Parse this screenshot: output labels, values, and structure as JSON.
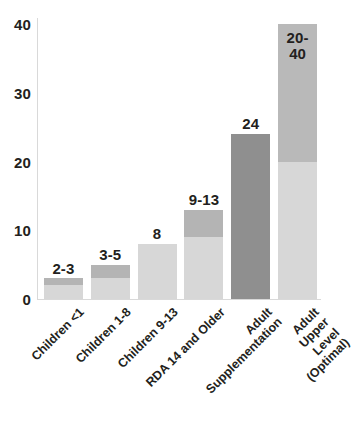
{
  "chart_data": {
    "type": "bar",
    "title": "",
    "xlabel": "",
    "ylabel": "",
    "ylim": [
      0,
      40
    ],
    "yticks": [
      0,
      10,
      20,
      30,
      40
    ],
    "ytick_labels": [
      "0",
      "10",
      "20",
      "30",
      "40"
    ],
    "grid": false,
    "legend": "none",
    "orientation": "vertical",
    "note": "Each bar shows a recommended intake range; lighter lower segment is the low end of the range, darker upper segment extends to the high end.",
    "categories": [
      "Children <1",
      "Children 1-8",
      "Children 9-13",
      "RDA 14 and Older",
      "Adult Supplementation",
      "Adult Upper Level\n(Optimal)"
    ],
    "bars": [
      {
        "category": "Children <1",
        "label": "2-3",
        "label_position": "outside",
        "low": 2,
        "high": 3,
        "value": 3,
        "segments": [
          {
            "name": "range-upper",
            "from": 2,
            "to": 3,
            "color": "#b4b4b4"
          },
          {
            "name": "range-lower",
            "from": 0,
            "to": 2,
            "color": "#d7d7d7"
          }
        ]
      },
      {
        "category": "Children 1-8",
        "label": "3-5",
        "label_position": "outside",
        "low": 3,
        "high": 5,
        "value": 5,
        "segments": [
          {
            "name": "range-upper",
            "from": 3,
            "to": 5,
            "color": "#b4b4b4"
          },
          {
            "name": "range-lower",
            "from": 0,
            "to": 3,
            "color": "#d7d7d7"
          }
        ]
      },
      {
        "category": "Children 9-13",
        "label": "8",
        "label_position": "outside",
        "low": 8,
        "high": 8,
        "value": 8,
        "segments": [
          {
            "name": "value",
            "from": 0,
            "to": 8,
            "color": "#d7d7d7"
          }
        ]
      },
      {
        "category": "RDA 14 and Older",
        "label": "9-13",
        "label_position": "outside",
        "low": 9,
        "high": 13,
        "value": 13,
        "segments": [
          {
            "name": "range-upper",
            "from": 9,
            "to": 13,
            "color": "#b4b4b4"
          },
          {
            "name": "range-lower",
            "from": 0,
            "to": 9,
            "color": "#d7d7d7"
          }
        ]
      },
      {
        "category": "Adult Supplementation",
        "label": "24",
        "label_position": "outside",
        "low": 24,
        "high": 24,
        "value": 24,
        "segments": [
          {
            "name": "value",
            "from": 0,
            "to": 24,
            "color": "#8f8f8f"
          }
        ]
      },
      {
        "category": "Adult Upper Level (Optimal)",
        "label": "20-\n40",
        "label_position": "inside",
        "low": 20,
        "high": 40,
        "value": 40,
        "segments": [
          {
            "name": "range-upper",
            "from": 20,
            "to": 40,
            "color": "#b9b9b9"
          },
          {
            "name": "range-lower",
            "from": 0,
            "to": 20,
            "color": "#d7d7d7"
          }
        ]
      }
    ]
  },
  "axis": {
    "y_ticks": [
      {
        "label": "40",
        "value": 40
      },
      {
        "label": "30",
        "value": 30
      },
      {
        "label": "20",
        "value": 20
      },
      {
        "label": "10",
        "value": 10
      },
      {
        "label": "0",
        "value": 0
      }
    ]
  },
  "colors": {
    "text": "#231f20",
    "axis": "#d9d9d9",
    "bar_light": "#d7d7d7",
    "bar_medium": "#b4b4b4",
    "bar_dark": "#8f8f8f",
    "background": "#ffffff"
  }
}
